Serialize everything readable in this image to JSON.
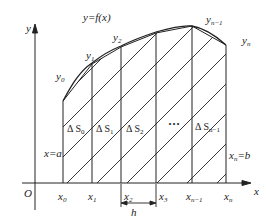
{
  "figure": {
    "curve_label": "y=f(x)",
    "axis": {
      "x_label": "x",
      "y_label": "y",
      "origin_label": "O"
    },
    "points": [
      {
        "x_label": "x",
        "x_sub": "0",
        "y_label": "y",
        "y_sub": "0"
      },
      {
        "x_label": "x",
        "x_sub": "1",
        "y_label": "y",
        "y_sub": "1"
      },
      {
        "x_label": "x",
        "x_sub": "2",
        "y_label": "y",
        "y_sub": "2"
      },
      {
        "x_label": "x",
        "x_sub": "3"
      },
      {
        "x_label": "x",
        "x_sub": "n−1",
        "y_label": "y",
        "y_sub": "n−1"
      },
      {
        "x_label": "x",
        "x_sub": "n",
        "y_label": "y",
        "y_sub": "n"
      }
    ],
    "areas": [
      {
        "prefix": "Δ S",
        "sub": "0"
      },
      {
        "prefix": "Δ S",
        "sub": "1"
      },
      {
        "prefix": "Δ S",
        "sub": "2"
      },
      {
        "prefix": "Δ S",
        "sub": "n−1"
      }
    ],
    "ellipsis": "···",
    "left_bound_label": "x=a",
    "right_bound": {
      "x": "x",
      "sub": "n",
      "rest": "=b"
    },
    "step_label": "h",
    "colors": {
      "line": "#222222",
      "background": "#ffffff"
    }
  }
}
